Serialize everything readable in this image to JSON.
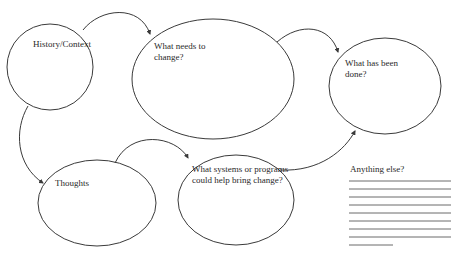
{
  "diagram": {
    "type": "graphic-organizer",
    "nodes": [
      {
        "id": "history",
        "label": "History/Context"
      },
      {
        "id": "change",
        "label": "What needs to\nchange?"
      },
      {
        "id": "done",
        "label": "What has been\ndone?"
      },
      {
        "id": "thoughts",
        "label": "Thoughts"
      },
      {
        "id": "systems",
        "label": "What systems or programs\ncould help bring change?"
      }
    ],
    "edges": [
      {
        "from": "history",
        "to": "change"
      },
      {
        "from": "change",
        "to": "done"
      },
      {
        "from": "history",
        "to": "thoughts"
      },
      {
        "from": "thoughts",
        "to": "systems"
      },
      {
        "from": "systems",
        "to": "done"
      }
    ],
    "notes": {
      "label": "Anything else?",
      "line_count": 9
    }
  },
  "colors": {
    "stroke": "#3a3a3a",
    "lines": "#6a6a6a",
    "background": "#ffffff"
  }
}
